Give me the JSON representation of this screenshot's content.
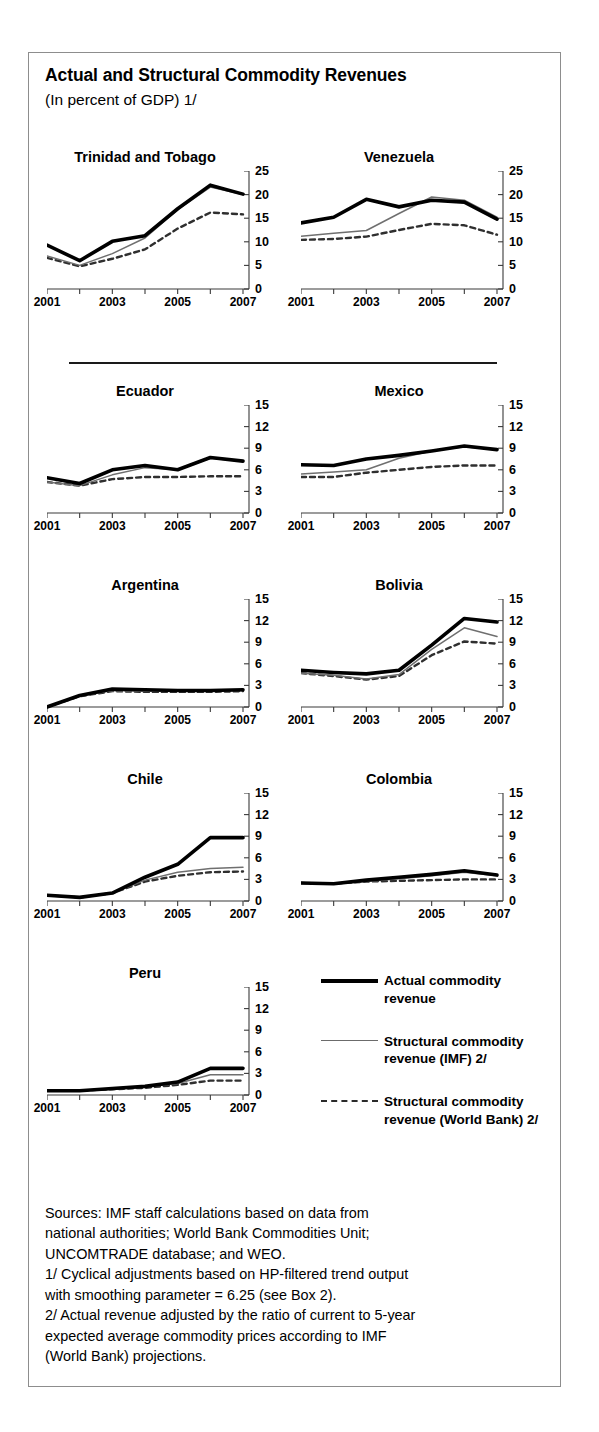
{
  "figure": {
    "title": "Actual and Structural Commodity Revenues",
    "subtitle": "(In percent of GDP) 1/"
  },
  "legend": {
    "items": [
      {
        "name": "actual",
        "label": "Actual commodity revenue",
        "style": "thick-solid-black",
        "color": "#000000"
      },
      {
        "name": "imf",
        "label": "Structural commodity revenue (IMF) 2/",
        "style": "thin-solid-gray",
        "color": "#6b6b6b"
      },
      {
        "name": "worldbank",
        "label": "Structural commodity revenue (World Bank) 2/",
        "style": "dashed-gray",
        "color": "#2a2a2a"
      }
    ]
  },
  "footnotes": {
    "lines": [
      "Sources:  IMF staff calculations based on data from",
      "national authorities; World Bank Commodities Unit;",
      "UNCOMTRADE database; and WEO.",
      "1/ Cyclical adjustments based on HP-filtered trend output",
      "with smoothing parameter = 6.25 (see Box 2).",
      "2/ Actual revenue adjusted by the ratio of current to 5-year",
      "expected average commodity prices according to IMF",
      "(World Bank) projections."
    ]
  },
  "chart_data": [
    {
      "type": "line",
      "title": "Trinidad and Tobago",
      "xlabel": "",
      "ylabel": "",
      "x": [
        2001,
        2002,
        2003,
        2004,
        2005,
        2006,
        2007
      ],
      "xticklabels": [
        "2001",
        "",
        "2003",
        "",
        "2005",
        "",
        "2007"
      ],
      "ylim": [
        0,
        25
      ],
      "yticks": [
        0,
        5,
        10,
        15,
        20,
        25
      ],
      "grid": false,
      "series": [
        {
          "name": "Actual commodity revenue",
          "values": [
            9.3,
            6.0,
            10.1,
            11.3,
            17.0,
            22.0,
            20.1
          ]
        },
        {
          "name": "Structural commodity revenue (IMF) 2/",
          "values": [
            7.0,
            5.0,
            7.5,
            10.8,
            16.8,
            21.6,
            20.0
          ]
        },
        {
          "name": "Structural commodity revenue (World Bank) 2/",
          "values": [
            6.6,
            4.8,
            6.4,
            8.4,
            12.8,
            16.2,
            15.8
          ]
        }
      ]
    },
    {
      "type": "line",
      "title": "Venezuela",
      "xlabel": "",
      "ylabel": "",
      "x": [
        2001,
        2002,
        2003,
        2004,
        2005,
        2006,
        2007
      ],
      "xticklabels": [
        "2001",
        "",
        "2003",
        "",
        "2005",
        "",
        "2007"
      ],
      "ylim": [
        0,
        25
      ],
      "yticks": [
        0,
        5,
        10,
        15,
        20,
        25
      ],
      "grid": false,
      "series": [
        {
          "name": "Actual commodity revenue",
          "values": [
            14.0,
            15.2,
            19.0,
            17.4,
            18.8,
            18.4,
            14.8
          ]
        },
        {
          "name": "Structural commodity revenue (IMF) 2/",
          "values": [
            11.2,
            11.8,
            12.4,
            16.0,
            19.5,
            18.8,
            15.2
          ]
        },
        {
          "name": "Structural commodity revenue (World Bank) 2/",
          "values": [
            10.4,
            10.6,
            11.1,
            12.5,
            13.8,
            13.5,
            11.5
          ]
        }
      ]
    },
    {
      "type": "line",
      "title": "Ecuador",
      "xlabel": "",
      "ylabel": "",
      "x": [
        2001,
        2002,
        2003,
        2004,
        2005,
        2006,
        2007
      ],
      "xticklabels": [
        "2001",
        "",
        "2003",
        "",
        "2005",
        "",
        "2007"
      ],
      "ylim": [
        0,
        15
      ],
      "yticks": [
        0,
        3,
        6,
        9,
        12,
        15
      ],
      "grid": false,
      "series": [
        {
          "name": "Actual commodity revenue",
          "values": [
            4.9,
            4.1,
            6.0,
            6.6,
            6.0,
            7.7,
            7.2
          ]
        },
        {
          "name": "Structural commodity revenue (IMF) 2/",
          "values": [
            4.3,
            3.8,
            5.3,
            6.3,
            6.0,
            7.6,
            7.2
          ]
        },
        {
          "name": "Structural commodity revenue (World Bank) 2/",
          "values": [
            4.3,
            3.8,
            4.7,
            5.0,
            5.0,
            5.1,
            5.1
          ]
        }
      ]
    },
    {
      "type": "line",
      "title": "Mexico",
      "xlabel": "",
      "ylabel": "",
      "x": [
        2001,
        2002,
        2003,
        2004,
        2005,
        2006,
        2007
      ],
      "xticklabels": [
        "2001",
        "",
        "2003",
        "",
        "2005",
        "",
        "2007"
      ],
      "ylim": [
        0,
        15
      ],
      "yticks": [
        0,
        3,
        6,
        9,
        12,
        15
      ],
      "grid": false,
      "series": [
        {
          "name": "Actual commodity revenue",
          "values": [
            6.7,
            6.6,
            7.5,
            8.0,
            8.6,
            9.3,
            8.8
          ]
        },
        {
          "name": "Structural commodity revenue (IMF) 2/",
          "values": [
            5.4,
            5.7,
            6.0,
            7.6,
            8.6,
            9.2,
            8.8
          ]
        },
        {
          "name": "Structural commodity revenue (World Bank) 2/",
          "values": [
            5.0,
            5.0,
            5.6,
            6.0,
            6.4,
            6.6,
            6.6
          ]
        }
      ]
    },
    {
      "type": "line",
      "title": "Argentina",
      "xlabel": "",
      "ylabel": "",
      "x": [
        2001,
        2002,
        2003,
        2004,
        2005,
        2006,
        2007
      ],
      "xticklabels": [
        "2001",
        "",
        "2003",
        "",
        "2005",
        "",
        "2007"
      ],
      "ylim": [
        0,
        15
      ],
      "yticks": [
        0,
        3,
        6,
        9,
        12,
        15
      ],
      "grid": false,
      "series": [
        {
          "name": "Actual commodity revenue",
          "values": [
            0.0,
            1.6,
            2.5,
            2.4,
            2.3,
            2.3,
            2.4
          ]
        },
        {
          "name": "Structural commodity revenue (IMF) 2/",
          "values": [
            0.0,
            1.5,
            2.3,
            2.2,
            2.2,
            2.2,
            2.3
          ]
        },
        {
          "name": "Structural commodity revenue (World Bank) 2/",
          "values": [
            0.0,
            1.5,
            2.2,
            2.1,
            2.1,
            2.1,
            2.2
          ]
        }
      ]
    },
    {
      "type": "line",
      "title": "Bolivia",
      "xlabel": "",
      "ylabel": "",
      "x": [
        2001,
        2002,
        2003,
        2004,
        2005,
        2006,
        2007
      ],
      "xticklabels": [
        "2001",
        "",
        "2003",
        "",
        "2005",
        "",
        "2007"
      ],
      "ylim": [
        0,
        15
      ],
      "yticks": [
        0,
        3,
        6,
        9,
        12,
        15
      ],
      "grid": false,
      "series": [
        {
          "name": "Actual commodity revenue",
          "values": [
            5.1,
            4.8,
            4.6,
            5.1,
            8.6,
            12.3,
            11.8
          ]
        },
        {
          "name": "Structural commodity revenue (IMF) 2/",
          "values": [
            4.7,
            4.4,
            3.9,
            4.5,
            8.0,
            11.0,
            9.8
          ]
        },
        {
          "name": "Structural commodity revenue (World Bank) 2/",
          "values": [
            4.7,
            4.3,
            3.8,
            4.3,
            7.2,
            9.1,
            8.8
          ]
        }
      ]
    },
    {
      "type": "line",
      "title": "Chile",
      "xlabel": "",
      "ylabel": "",
      "x": [
        2001,
        2002,
        2003,
        2004,
        2005,
        2006,
        2007
      ],
      "xticklabels": [
        "2001",
        "",
        "2003",
        "",
        "2005",
        "",
        "2007"
      ],
      "ylim": [
        0,
        15
      ],
      "yticks": [
        0,
        3,
        6,
        9,
        12,
        15
      ],
      "grid": false,
      "series": [
        {
          "name": "Actual commodity revenue",
          "values": [
            0.8,
            0.5,
            1.1,
            3.3,
            5.1,
            8.8,
            8.8
          ]
        },
        {
          "name": "Structural commodity revenue (IMF) 2/",
          "values": [
            0.8,
            0.5,
            1.1,
            2.9,
            4.0,
            4.5,
            4.7
          ]
        },
        {
          "name": "Structural commodity revenue (World Bank) 2/",
          "values": [
            0.8,
            0.5,
            1.1,
            2.7,
            3.5,
            4.0,
            4.1
          ]
        }
      ]
    },
    {
      "type": "line",
      "title": "Colombia",
      "xlabel": "",
      "ylabel": "",
      "x": [
        2001,
        2002,
        2003,
        2004,
        2005,
        2006,
        2007
      ],
      "xticklabels": [
        "2001",
        "",
        "2003",
        "",
        "2005",
        "",
        "2007"
      ],
      "ylim": [
        0,
        15
      ],
      "yticks": [
        0,
        3,
        6,
        9,
        12,
        15
      ],
      "grid": false,
      "series": [
        {
          "name": "Actual commodity revenue",
          "values": [
            2.5,
            2.4,
            2.9,
            3.3,
            3.7,
            4.2,
            3.6
          ]
        },
        {
          "name": "Structural commodity revenue (IMF) 2/",
          "values": [
            2.5,
            2.4,
            2.7,
            3.1,
            3.5,
            4.0,
            3.5
          ]
        },
        {
          "name": "Structural commodity revenue (World Bank) 2/",
          "values": [
            2.5,
            2.4,
            2.7,
            2.8,
            2.9,
            3.0,
            3.0
          ]
        }
      ]
    },
    {
      "type": "line",
      "title": "Peru",
      "xlabel": "",
      "ylabel": "",
      "x": [
        2001,
        2002,
        2003,
        2004,
        2005,
        2006,
        2007
      ],
      "xticklabels": [
        "2001",
        "",
        "2003",
        "",
        "2005",
        "",
        "2007"
      ],
      "ylim": [
        0,
        15
      ],
      "yticks": [
        0,
        3,
        6,
        9,
        12,
        15
      ],
      "grid": false,
      "series": [
        {
          "name": "Actual commodity revenue",
          "values": [
            0.6,
            0.6,
            0.9,
            1.2,
            1.8,
            3.7,
            3.7
          ]
        },
        {
          "name": "Structural commodity revenue (IMF) 2/",
          "values": [
            0.6,
            0.6,
            0.8,
            1.1,
            1.6,
            2.8,
            2.8
          ]
        },
        {
          "name": "Structural commodity revenue (World Bank) 2/",
          "values": [
            0.6,
            0.6,
            0.8,
            1.0,
            1.4,
            2.0,
            2.0
          ]
        }
      ]
    }
  ]
}
